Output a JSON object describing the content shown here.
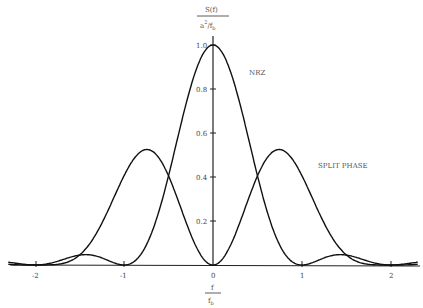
{
  "chart_data": {
    "type": "line",
    "title": "",
    "xlabel": "f / f_b",
    "ylabel": "S(f) / (a^2 / f_b)",
    "xlim": [
      -2.3,
      2.3
    ],
    "ylim": [
      0,
      1.0
    ],
    "x_ticks": [
      "-2",
      "-1",
      "0",
      "1",
      "2"
    ],
    "y_ticks": [
      "0.2",
      "0.4",
      "0.6",
      "0.8",
      "1.0"
    ],
    "grid": false,
    "series": [
      {
        "name": "NRZ",
        "formula": "sinc^2(f/f_b)",
        "x": [
          -2.3,
          -2,
          -1.5,
          -1,
          -0.75,
          -0.5,
          -0.25,
          0,
          0.25,
          0.5,
          0.75,
          1,
          1.5,
          2,
          2.3
        ],
        "values": [
          0.016,
          0.0,
          0.045,
          0.0,
          0.162,
          0.405,
          0.811,
          1.0,
          0.811,
          0.405,
          0.162,
          0.0,
          0.045,
          0.0,
          0.016
        ]
      },
      {
        "name": "SPLIT PHASE",
        "formula": "sinc^2(f/2f_b) * sin^2(pi f/2f_b)",
        "x": [
          -2.3,
          -2,
          -1.5,
          -1,
          -0.75,
          -0.5,
          -0.25,
          0,
          0.25,
          0.5,
          0.75,
          1,
          1.5,
          2,
          2.3
        ],
        "values": [
          0.02,
          0.0,
          0.09,
          0.405,
          0.51,
          0.405,
          0.143,
          0.0,
          0.143,
          0.405,
          0.51,
          0.405,
          0.09,
          0.0,
          0.02
        ]
      }
    ],
    "annotations": [
      "NRZ",
      "SPLIT PHASE"
    ]
  },
  "labels": {
    "y_num": "S(f)",
    "y_den": "a",
    "y_den_sup": "2",
    "y_den_rest": "/f",
    "y_den_sub": "b",
    "x_num": "f",
    "x_den": "f",
    "x_den_sub": "b",
    "nrz": "NRZ",
    "split_phase": "SPLIT PHASE",
    "tick_m2": "-2",
    "tick_m1": "-1",
    "tick_0": "0",
    "tick_1": "1",
    "tick_2": "2",
    "tick_y02": "0.2",
    "tick_y04": "0.4",
    "tick_y06": "0.6",
    "tick_y08": "0.8",
    "tick_y10": "1.0"
  }
}
